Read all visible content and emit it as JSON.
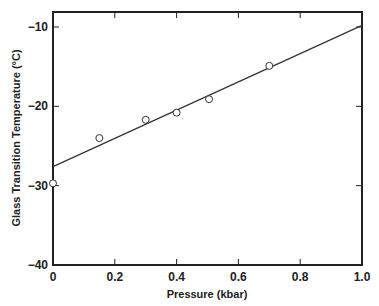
{
  "chart_data": {
    "type": "scatter",
    "title": "",
    "xlabel": "Pressure (kbar)",
    "ylabel": "Glass Transition Temperature (°C)",
    "xlim": [
      0,
      1.0
    ],
    "ylim": [
      -40,
      -8
    ],
    "x_ticks": [
      0,
      0.2,
      0.4,
      0.6,
      0.8,
      1.0
    ],
    "x_tick_labels": [
      "0",
      "0.2",
      "0.4",
      "0.6",
      "0.8",
      "1.0"
    ],
    "y_ticks": [
      -10,
      -20,
      -30,
      -40
    ],
    "y_tick_labels": [
      "−10",
      "−20",
      "−30",
      "−40"
    ],
    "grid": false,
    "legend": null,
    "series": [
      {
        "name": "measured",
        "marker": "open-circle",
        "x": [
          0,
          0.15,
          0.3,
          0.4,
          0.505,
          0.7
        ],
        "y": [
          -29.7,
          -24.0,
          -21.7,
          -20.8,
          -19.1,
          -14.9
        ]
      },
      {
        "name": "linear fit",
        "style": "line",
        "x": [
          0,
          1.0
        ],
        "y": [
          -27.6,
          -9.8
        ]
      }
    ]
  }
}
